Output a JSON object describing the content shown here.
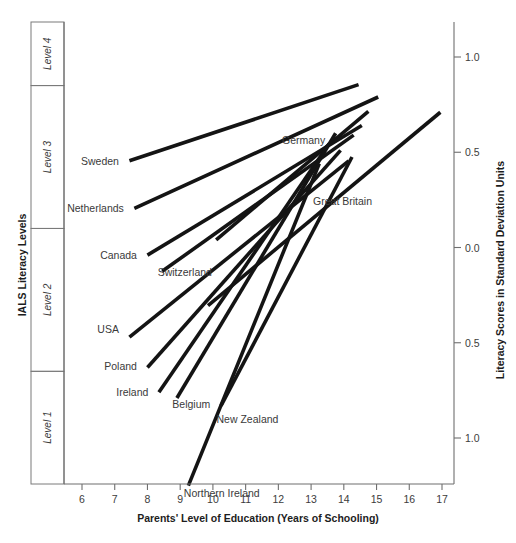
{
  "chart_data": {
    "type": "line",
    "title": "",
    "xlabel": "Parents' Level of Education (Years of Schooling)",
    "ylabel": "Literacy Scores in Standard Deviation Units",
    "left_axis_label": "IALS Literacy Levels",
    "xlim": [
      5.3,
      17.6
    ],
    "ylim": [
      -1.45,
      1.25
    ],
    "xticks": [
      6,
      7,
      8,
      9,
      10,
      11,
      12,
      13,
      14,
      15,
      16,
      17
    ],
    "xtick_labels": [
      "6",
      "7",
      "8",
      "9",
      "10",
      "11",
      "12",
      "13",
      "14",
      "15",
      "16",
      "17"
    ],
    "yticks": [
      1.0,
      0.5,
      0.0,
      -0.5,
      -1.0
    ],
    "ytick_labels": [
      "1.0",
      "0.5",
      "0.0",
      "0.5",
      "1.0"
    ],
    "grid": false,
    "legend_position": "inline-labels",
    "literacy_levels": [
      {
        "label": "Level 4",
        "y_top": 1.25,
        "y_bottom": 0.85
      },
      {
        "label": "Level 3",
        "y_top": 0.85,
        "y_bottom": 0.1
      },
      {
        "label": "Level 2",
        "y_top": 0.1,
        "y_bottom": -0.65
      },
      {
        "label": "Level 1",
        "y_top": -0.65,
        "y_bottom": -1.45
      }
    ],
    "series": [
      {
        "name": "Sweden",
        "x": [
          7.45,
          14.45
        ],
        "y": [
          0.455,
          0.855
        ],
        "label_x": 7.25,
        "label_y": 0.455,
        "label_anchor": "end"
      },
      {
        "name": "Netherlands",
        "x": [
          7.6,
          15.05
        ],
        "y": [
          0.205,
          0.79
        ],
        "label_x": 7.4,
        "label_y": 0.205,
        "label_anchor": "end"
      },
      {
        "name": "Germany",
        "x": [
          10.1,
          14.75
        ],
        "y": [
          0.04,
          0.715
        ],
        "label_x": 12.05,
        "label_y": 0.565,
        "label_anchor": "start"
      },
      {
        "name": "Canada",
        "x": [
          8.0,
          14.55
        ],
        "y": [
          -0.04,
          0.64
        ],
        "label_x": 7.8,
        "label_y": -0.04,
        "label_anchor": "end"
      },
      {
        "name": "Switzerland",
        "x": [
          8.45,
          14.3
        ],
        "y": [
          -0.125,
          0.59
        ],
        "label_x": 8.25,
        "label_y": -0.13,
        "label_anchor": "start"
      },
      {
        "name": "Great Britain",
        "x": [
          9.85,
          16.95
        ],
        "y": [
          -0.305,
          0.71
        ],
        "label_x": 13.0,
        "label_y": 0.245,
        "label_anchor": "start"
      },
      {
        "name": "USA",
        "x": [
          7.45,
          14.15
        ],
        "y": [
          -0.47,
          0.455
        ],
        "label_x": 7.25,
        "label_y": -0.43,
        "label_anchor": "end"
      },
      {
        "name": "Poland",
        "x": [
          8.0,
          13.9
        ],
        "y": [
          -0.63,
          0.51
        ],
        "label_x": 7.8,
        "label_y": -0.62,
        "label_anchor": "end"
      },
      {
        "name": "Ireland",
        "x": [
          8.35,
          13.55
        ],
        "y": [
          -0.76,
          0.545
        ],
        "label_x": 8.15,
        "label_y": -0.76,
        "label_anchor": "end"
      },
      {
        "name": "Belgium",
        "x": [
          8.9,
          13.75
        ],
        "y": [
          -0.79,
          0.6
        ],
        "label_x": 8.7,
        "label_y": -0.82,
        "label_anchor": "start"
      },
      {
        "name": "New Zealand",
        "x": [
          10.25,
          14.25
        ],
        "y": [
          -0.83,
          0.475
        ],
        "label_x": 10.05,
        "label_y": -0.9,
        "label_anchor": "start"
      },
      {
        "name": "Northern Ireland",
        "x": [
          9.25,
          13.25
        ],
        "y": [
          -1.25,
          0.44
        ],
        "label_x": 9.05,
        "label_y": -1.29,
        "label_anchor": "start"
      }
    ]
  }
}
